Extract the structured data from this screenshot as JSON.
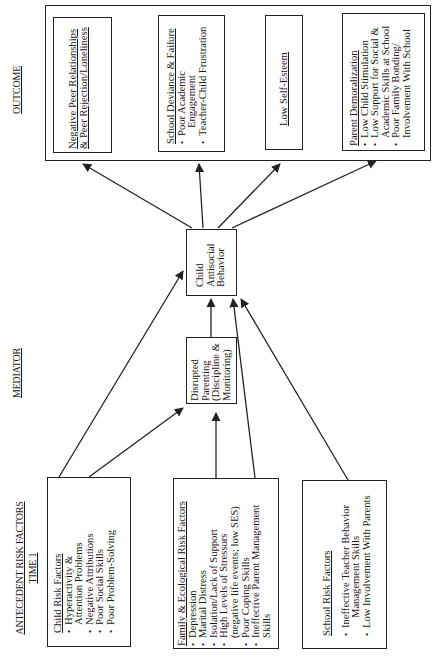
{
  "section_labels": {
    "outcome": "OUTCOME",
    "mediator": "MEDIATOR",
    "antecedent": "ANTECEDENT RISK FACTORS",
    "time": "TIME 1"
  },
  "outcome": {
    "peer": {
      "title_line1": "Negative Peer Relationships",
      "title_line2": "& Peer Rejection/Loneliness"
    },
    "school_deviance": {
      "title": "School Deviance & Failure",
      "items": [
        "Poor Academic",
        "Engagement",
        "Teacher-Child Frustration"
      ]
    },
    "self_esteem": {
      "title": "Low Self-Esteem"
    },
    "parent_demoralization": {
      "title": "Parent Demoralization",
      "items": [
        "Low Child Stimulation",
        "Low Support for Social &",
        "Academic Skills at School",
        "Poor Family Bonding/",
        "Involvement With School"
      ]
    }
  },
  "mediator": {
    "antisocial": {
      "lines": [
        "Child",
        "Antisocial",
        "Behavior"
      ]
    },
    "disrupted": {
      "lines": [
        "Disrupted",
        "Parenting",
        "(Discipline &",
        "Monitoring)"
      ]
    }
  },
  "antecedents": {
    "child": {
      "title": "Child Risk Factors",
      "items": [
        "Hyperactivity &",
        "Attention Problems",
        "Negative Attributions",
        "Poor Social Skills",
        "Poor Problem-Solving"
      ]
    },
    "family": {
      "title": "Family & Ecological Risk Factors",
      "items": [
        "Depression",
        "Marital Distress",
        "Isolation/Lack of Support",
        "High Levels of Stressors",
        "(negative life events; low SES)",
        "Poor Coping Skills",
        "Ineffective Parent Management",
        "Skills"
      ]
    },
    "school": {
      "title": "School Risk Factors",
      "items": [
        "Ineffective Teacher Behavior",
        "Management Skills",
        "Low Involvement With Parents"
      ]
    }
  },
  "colors": {
    "line": "#222222",
    "background": "#ffffff"
  }
}
